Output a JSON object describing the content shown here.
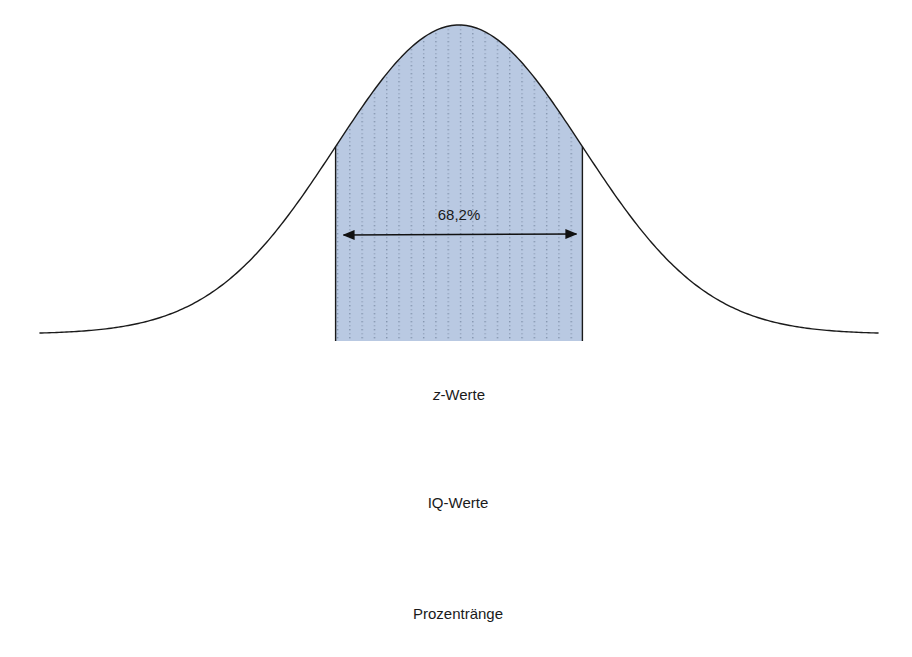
{
  "chart_data": {
    "type": "area",
    "title": "",
    "curve": "normal_pdf",
    "shaded_range": [
      -1,
      1
    ],
    "shaded_color": "#b9c9e2",
    "annotation": {
      "label": "68,2%",
      "from": -1,
      "to": 1
    },
    "x": [
      -3,
      -2,
      -1,
      0,
      1,
      2,
      3
    ],
    "axes": [
      {
        "name": "z",
        "xlabel": "z-Werte",
        "xlabel_prefix": "z",
        "xlabel_suffix": "-Werte",
        "ticks": [
          -3,
          -2,
          -1,
          0,
          1,
          2,
          3
        ],
        "tick_labels": [
          "−3",
          "−2",
          "−1",
          "0",
          "1",
          "2",
          "3"
        ]
      },
      {
        "name": "iq",
        "xlabel": "IQ-Werte",
        "ticks": [
          55,
          70,
          85,
          100,
          115,
          130,
          145
        ],
        "tick_labels": [
          "55",
          "70",
          "85",
          "100",
          "115",
          "130",
          "145"
        ]
      },
      {
        "name": "percentile",
        "xlabel": "Prozentränge",
        "ticks": [
          0.1,
          2.3,
          15.9,
          50,
          84.1,
          97.7,
          99.9
        ],
        "tick_labels": [
          "0,1",
          "2,3",
          "15,9",
          "50",
          "84,1",
          "97,7",
          "99,9"
        ]
      }
    ],
    "xlim": [
      -3.4,
      3.4
    ],
    "grid": false,
    "legend": null
  }
}
